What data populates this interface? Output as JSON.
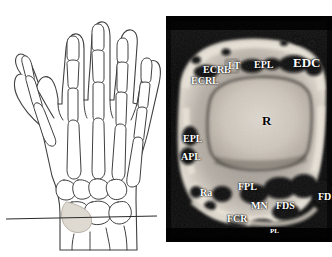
{
  "figure": {
    "panels": [
      {
        "id": "hand-diagram",
        "kind": "line-drawing",
        "description": "Dorsal outline of the hand with skeleton of phalanges, metacarpals and carpal bones; a horizontal line marks the axial section level through the distal radius"
      },
      {
        "id": "wrist-mri",
        "kind": "axial-mr-image",
        "description": "Axial MR image at the level of the distal radius"
      }
    ]
  },
  "hand_diagram": {
    "section_line_label": "",
    "stroke_color": "#3a3a3a",
    "fill_color": "#ffffff",
    "bone_shade": "#d8d3cb"
  },
  "mri": {
    "background_color": "#050505",
    "label_color": "#ffffff",
    "labels": [
      {
        "text": "ECRB",
        "x": 37,
        "y": 49,
        "size": "med",
        "tone": "light"
      },
      {
        "text": "LT",
        "x": 62,
        "y": 45,
        "size": "med",
        "tone": "light"
      },
      {
        "text": "EPL",
        "x": 88,
        "y": 44,
        "size": "med",
        "tone": "light"
      },
      {
        "text": "EDC",
        "x": 127,
        "y": 42,
        "size": "big",
        "tone": "light"
      },
      {
        "text": "ECRL",
        "x": 25,
        "y": 60,
        "size": "med",
        "tone": "light"
      },
      {
        "text": "R",
        "x": 96,
        "y": 100,
        "size": "big",
        "tone": "dark"
      },
      {
        "text": "EPL",
        "x": 17,
        "y": 118,
        "size": "med",
        "tone": "light"
      },
      {
        "text": "APL",
        "x": 15,
        "y": 136,
        "size": "med",
        "tone": "light"
      },
      {
        "text": "Ra",
        "x": 34,
        "y": 172,
        "size": "med",
        "tone": "light"
      },
      {
        "text": "FPL",
        "x": 72,
        "y": 168,
        "size": "med",
        "tone": "light"
      },
      {
        "text": "MN",
        "x": 85,
        "y": 187,
        "size": "med",
        "tone": "light"
      },
      {
        "text": "FDS",
        "x": 110,
        "y": 187,
        "size": "med",
        "tone": "light"
      },
      {
        "text": "FCR",
        "x": 61,
        "y": 199,
        "size": "med",
        "tone": "light"
      },
      {
        "text": "FD",
        "x": 152,
        "y": 178,
        "size": "med",
        "tone": "light"
      },
      {
        "text": "PL",
        "x": 104,
        "y": 213,
        "size": "small",
        "tone": "light"
      }
    ],
    "abbreviations": {
      "ECRB": "extensor carpi radialis brevis",
      "ECRL": "extensor carpi radialis longus",
      "LT": "Lister tubercle",
      "EPL": "extensor pollicis longus",
      "EDC": "extensor digitorum communis",
      "APL": "abductor pollicis longus",
      "R": "radius",
      "Ra": "radial artery",
      "FPL": "flexor pollicis longus",
      "MN": "median nerve",
      "FDS": "flexor digitorum superficialis",
      "FCR": "flexor carpi radialis",
      "FD": "flexor digitorum",
      "PL": "palmaris longus"
    }
  },
  "caption": {
    "text": ""
  }
}
